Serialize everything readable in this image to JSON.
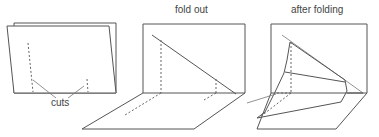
{
  "panels": [
    {
      "id": "folded-card",
      "title": "",
      "annotation": "cuts"
    },
    {
      "id": "fold-out",
      "title": "fold out"
    },
    {
      "id": "after-folding",
      "title": "after folding"
    }
  ],
  "colors": {
    "line": "#555555",
    "background": "#ffffff",
    "text": "#444444"
  }
}
